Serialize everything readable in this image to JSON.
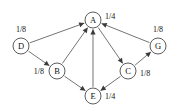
{
  "figure": {
    "type": "directed-graph",
    "title": "",
    "background_color": "#ffffff",
    "node_stroke_color": "#4a4a4a",
    "edge_color": "#5b5b5b",
    "arrow_color": "#3a3a3a",
    "text_color": "#111111"
  },
  "nodes": [
    {
      "id": "A",
      "label": "A",
      "x": 93,
      "y": 20,
      "r": 8,
      "value": "1/4",
      "value_x": 105,
      "value_y": 16,
      "value_align": "start"
    },
    {
      "id": "D",
      "label": "D",
      "x": 21,
      "y": 46,
      "r": 8,
      "value": "1/8",
      "value_x": 21,
      "value_y": 29,
      "value_align": "middle"
    },
    {
      "id": "G",
      "label": "G",
      "x": 158,
      "y": 46,
      "r": 8,
      "value": "1/8",
      "value_x": 158,
      "value_y": 29,
      "value_align": "middle"
    },
    {
      "id": "B",
      "label": "B",
      "x": 57,
      "y": 71,
      "r": 8,
      "value": "1/8",
      "value_x": 44,
      "value_y": 71,
      "value_align": "end"
    },
    {
      "id": "C",
      "label": "C",
      "x": 128,
      "y": 71,
      "r": 8,
      "value": "1/8",
      "value_x": 140,
      "value_y": 73,
      "value_align": "start"
    },
    {
      "id": "E",
      "label": "E",
      "x": 93,
      "y": 96,
      "r": 8,
      "value": "1/4",
      "value_x": 105,
      "value_y": 96,
      "value_align": "start"
    }
  ],
  "edges": [
    {
      "from": "D",
      "to": "A",
      "directed": true
    },
    {
      "from": "D",
      "to": "B",
      "directed": true
    },
    {
      "from": "B",
      "to": "A",
      "directed": true
    },
    {
      "from": "B",
      "to": "E",
      "directed": true
    },
    {
      "from": "E",
      "to": "A",
      "directed": true
    },
    {
      "from": "C",
      "to": "E",
      "directed": true
    },
    {
      "from": "A",
      "to": "C",
      "directed": true
    },
    {
      "from": "C",
      "to": "G",
      "directed": true
    },
    {
      "from": "G",
      "to": "A",
      "directed": true
    }
  ]
}
